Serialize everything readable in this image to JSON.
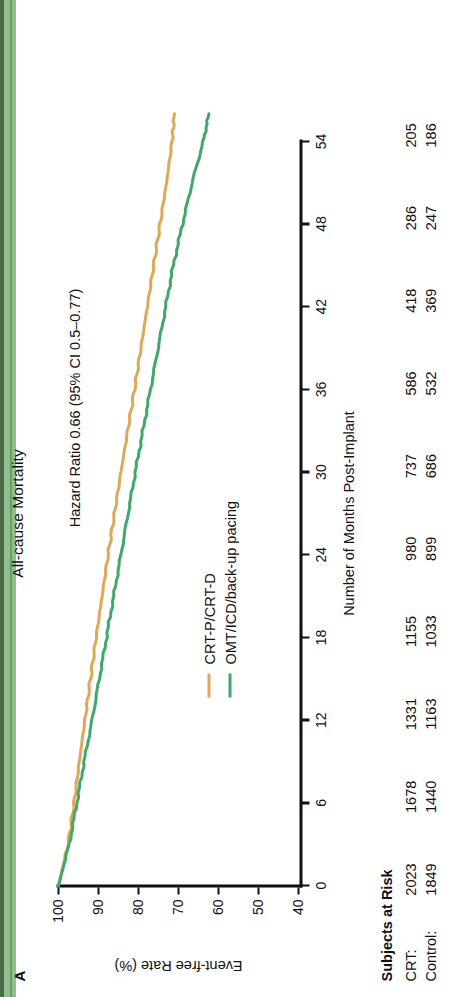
{
  "figure": {
    "panel_label": "A",
    "title": "All-cause Mortality",
    "annotation": "Hazard Ratio 0.66 (95% CI 0.5–0.77)"
  },
  "axes": {
    "y_title": "Event-free Rate (%)",
    "x_title": "Number of Months Post-Implant",
    "y_ticks": [
      "100",
      "90",
      "80",
      "70",
      "60",
      "50",
      "40"
    ],
    "x_ticks": [
      "0",
      "6",
      "12",
      "18",
      "24",
      "30",
      "36",
      "42",
      "48",
      "54"
    ]
  },
  "legend": {
    "items": [
      {
        "label": "CRT-P/CRT-D",
        "color": "#e0a856"
      },
      {
        "label": "OMT/ICD/back-up pacing",
        "color": "#3fa86a"
      }
    ]
  },
  "risk_table": {
    "title": "Subjects at Risk",
    "rows": [
      {
        "name": "CRT:",
        "values": [
          "2023",
          "1678",
          "1331",
          "1155",
          "980",
          "737",
          "586",
          "418",
          "286",
          "205"
        ]
      },
      {
        "name": "Control:",
        "values": [
          "1849",
          "1440",
          "1163",
          "1033",
          "899",
          "686",
          "532",
          "369",
          "247",
          "186"
        ]
      }
    ]
  },
  "chart_data": {
    "type": "line",
    "title": "All-cause Mortality",
    "xlabel": "Number of Months Post-Implant",
    "ylabel": "Event-free Rate (%)",
    "xlim": [
      0,
      56
    ],
    "ylim": [
      40,
      100
    ],
    "x_ticks": [
      0,
      6,
      12,
      18,
      24,
      30,
      36,
      42,
      48,
      54
    ],
    "y_ticks": [
      40,
      50,
      60,
      70,
      80,
      90,
      100
    ],
    "grid": false,
    "legend_position": "inside-lower-left",
    "annotation": "Hazard Ratio 0.66 (95% CI 0.5–0.77)",
    "x": [
      0,
      3,
      6,
      9,
      12,
      15,
      18,
      21,
      24,
      27,
      30,
      33,
      36,
      39,
      42,
      45,
      48,
      51,
      54,
      56
    ],
    "series": [
      {
        "name": "CRT-P/CRT-D",
        "color": "#e0a856",
        "values": [
          100,
          97.6,
          96.1,
          94.8,
          93.4,
          92.0,
          90.6,
          89.1,
          87.6,
          86.0,
          84.4,
          82.7,
          81.0,
          79.4,
          77.8,
          76.2,
          74.6,
          73.0,
          71.6,
          71.0
        ],
        "n_at_risk": [
          2023,
          null,
          1678,
          null,
          1331,
          null,
          1155,
          null,
          980,
          null,
          737,
          null,
          586,
          null,
          418,
          null,
          286,
          null,
          205,
          null
        ]
      },
      {
        "name": "OMT/ICD/back-up pacing",
        "color": "#3fa86a",
        "values": [
          100,
          97.3,
          95.4,
          93.6,
          91.6,
          89.8,
          88.0,
          86.2,
          84.4,
          82.6,
          80.8,
          78.9,
          77.0,
          75.1,
          73.2,
          71.3,
          69.0,
          66.6,
          63.8,
          62.4
        ],
        "n_at_risk": [
          1849,
          null,
          1440,
          null,
          1163,
          null,
          1033,
          null,
          899,
          null,
          686,
          null,
          532,
          null,
          369,
          null,
          247,
          null,
          186,
          null
        ]
      }
    ]
  }
}
